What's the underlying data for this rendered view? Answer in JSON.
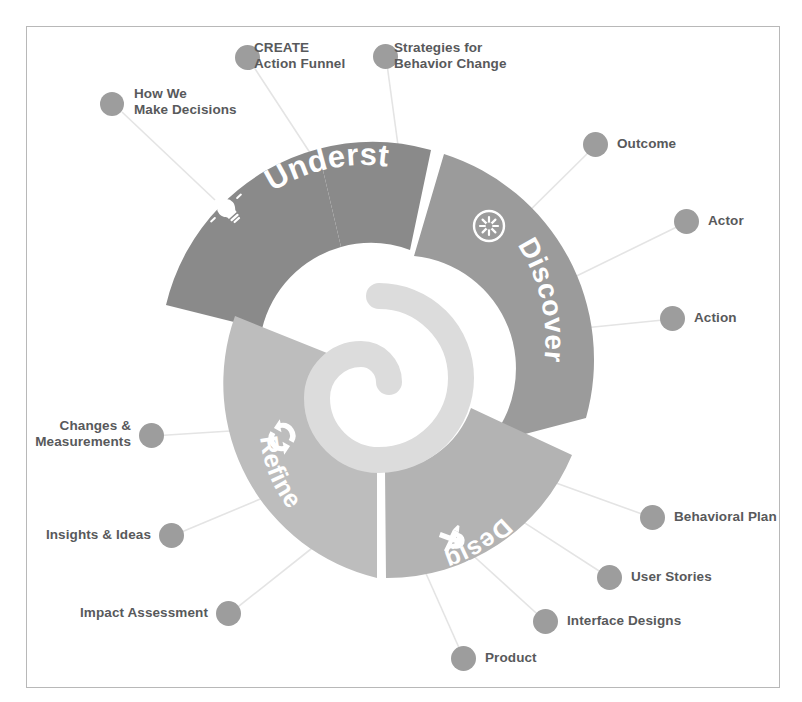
{
  "figure": {
    "frame": {
      "border_color": "#b8b8b8",
      "background": "#ffffff"
    }
  },
  "colors": {
    "understand": "#8a8a8a",
    "discover": "#9b9b9b",
    "design": "#b3b3b3",
    "refine": "#bdbdbd",
    "inner_spiral": "#dcdcdc",
    "dot": "#9d9d9d",
    "text": "#58595b",
    "connector": "#e2e2e2",
    "segment_text": "#ffffff"
  },
  "segments": [
    {
      "key": "understand",
      "label": "Understand",
      "icon": "lightbulb-icon"
    },
    {
      "key": "discover",
      "label": "Discover",
      "icon": "compass-star-icon"
    },
    {
      "key": "design",
      "label": "Design",
      "icon": "wrench-screwdriver-icon"
    },
    {
      "key": "refine",
      "label": "Refine",
      "icon": "cycle-arrows-icon"
    }
  ],
  "nodes": [
    {
      "key": "how-we-make-decisions",
      "label": "How We\nMake Decisions",
      "segment": "understand",
      "align": "right"
    },
    {
      "key": "create-action-funnel",
      "label": "CREATE\nAction Funnel",
      "segment": "understand",
      "align": "right"
    },
    {
      "key": "strategies-for-behavior-change",
      "label": "Strategies for\nBehavior Change",
      "segment": "understand",
      "align": "right"
    },
    {
      "key": "outcome",
      "label": "Outcome",
      "segment": "discover",
      "align": "right"
    },
    {
      "key": "actor",
      "label": "Actor",
      "segment": "discover",
      "align": "right"
    },
    {
      "key": "action",
      "label": "Action",
      "segment": "discover",
      "align": "right"
    },
    {
      "key": "behavioral-plan",
      "label": "Behavioral Plan",
      "segment": "design",
      "align": "right"
    },
    {
      "key": "user-stories",
      "label": "User Stories",
      "segment": "design",
      "align": "right"
    },
    {
      "key": "interface-designs",
      "label": "Interface Designs",
      "segment": "design",
      "align": "right"
    },
    {
      "key": "product",
      "label": "Product",
      "segment": "design",
      "align": "right"
    },
    {
      "key": "impact-assessment",
      "label": "Impact Assessment",
      "segment": "refine",
      "align": "left"
    },
    {
      "key": "insights-ideas",
      "label": "Insights & Ideas",
      "segment": "refine",
      "align": "left"
    },
    {
      "key": "changes-measurements",
      "label": "Changes &\nMeasurements",
      "segment": "refine",
      "align": "left"
    }
  ]
}
